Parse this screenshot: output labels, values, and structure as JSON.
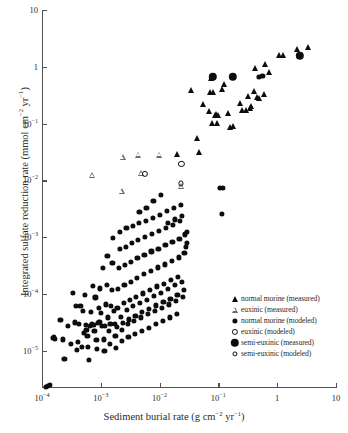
{
  "chart_data": {
    "type": "scatter",
    "title": "",
    "xlabel": "Sediment burial rate (g cm−2 yr−1)",
    "ylabel": "Integrated sulfate reduction rate (mmol cm−2 yr−1)",
    "xscale": "log",
    "yscale": "log",
    "xlim": [
      0.0001,
      10
    ],
    "ylim": [
      2.2e-06,
      10
    ],
    "grid": false,
    "legend_position": "lower-right-inside",
    "xticks": [
      {
        "value": 0.0001,
        "label": "10",
        "exp": "−4"
      },
      {
        "value": 0.001,
        "label": "10",
        "exp": "−3"
      },
      {
        "value": 0.01,
        "label": "10",
        "exp": "−2"
      },
      {
        "value": 0.1,
        "label": "10",
        "exp": "−1"
      },
      {
        "value": 1,
        "label": "1",
        "exp": ""
      },
      {
        "value": 10,
        "label": "10",
        "exp": ""
      }
    ],
    "yticks": [
      {
        "value": 10,
        "label": "10",
        "exp": ""
      },
      {
        "value": 1,
        "label": "1",
        "exp": ""
      },
      {
        "value": 0.1,
        "label": "10",
        "exp": "−1"
      },
      {
        "value": 0.01,
        "label": "10",
        "exp": "−2"
      },
      {
        "value": 0.001,
        "label": "10",
        "exp": "−3"
      },
      {
        "value": 0.0001,
        "label": "10",
        "exp": "−4"
      },
      {
        "value": 1e-05,
        "label": "10",
        "exp": "−5"
      }
    ],
    "series": [
      {
        "name": "normal marine (measured)",
        "marker": "filled-triangle",
        "color": "#0d0d0d",
        "points": [
          [
            0.0195,
            0.0295
          ],
          [
            0.0345,
            0.383
          ],
          [
            0.043,
            0.0555
          ],
          [
            0.046,
            0.0315
          ],
          [
            0.0555,
            0.222
          ],
          [
            0.068,
            0.165
          ],
          [
            0.073,
            0.36
          ],
          [
            0.075,
            0.625
          ],
          [
            0.079,
            0.104
          ],
          [
            0.082,
            0.36
          ],
          [
            0.086,
            0.143
          ],
          [
            0.092,
            0.147
          ],
          [
            0.094,
            0.104
          ],
          [
            0.1,
            0.143
          ],
          [
            0.115,
            0.4
          ],
          [
            0.125,
            0.5
          ],
          [
            0.145,
            0.151
          ],
          [
            0.155,
            0.088
          ],
          [
            0.175,
            0.092
          ],
          [
            0.23,
            0.23
          ],
          [
            0.255,
            0.175
          ],
          [
            0.3,
            0.175
          ],
          [
            0.325,
            0.3
          ],
          [
            0.34,
            0.185
          ],
          [
            0.355,
            0.205
          ],
          [
            0.4,
            0.375
          ],
          [
            0.415,
            0.955
          ],
          [
            0.455,
            0.295
          ],
          [
            0.5,
            0.285
          ],
          [
            0.6,
            0.335
          ],
          [
            0.63,
            1.12
          ],
          [
            0.72,
            0.8
          ],
          [
            1.08,
            1.58
          ],
          [
            1.25,
            1.6
          ],
          [
            2.15,
            2.05
          ],
          [
            3.4,
            2.25
          ]
        ]
      },
      {
        "name": "euxinic (measured)",
        "marker": "open-triangle",
        "color": "#6e6a6b",
        "points": [
          [
            0.00072,
            0.0122
          ],
          [
            0.00225,
            0.0064
          ],
          [
            0.00235,
            0.0255
          ],
          [
            0.00425,
            0.0285
          ],
          [
            0.0049,
            0.0133
          ],
          [
            0.0098,
            0.0285
          ],
          [
            0.0235,
            0.0079
          ]
        ]
      },
      {
        "name": "normal marine (modeled)",
        "marker": "filled-circle",
        "color": "#0d0d0d",
        "points": [
          [
            0.000116,
            2.3e-06
          ],
          [
            0.000128,
            2.4e-06
          ],
          [
            0.000137,
            2.5e-06
          ],
          [
            0.000152,
            1.68e-05
          ],
          [
            0.000158,
            1.75e-05
          ],
          [
            0.000168,
            1.62e-05
          ],
          [
            0.000205,
            3.45e-05
          ],
          [
            0.000225,
            1.58e-05
          ],
          [
            0.00024,
            7.2e-06
          ],
          [
            0.00028,
            2.75e-05
          ],
          [
            0.00031,
            1.32e-05
          ],
          [
            0.00034,
            0.000105
          ],
          [
            0.00036,
            3.15e-05
          ],
          [
            0.00038,
            6.05e-05
          ],
          [
            0.00039,
            1.02e-05
          ],
          [
            0.00041,
            1.45e-05
          ],
          [
            0.00043,
            2.95e-05
          ],
          [
            0.00045,
            6.2e-05
          ],
          [
            0.00047,
            1.18e-05
          ],
          [
            0.00049,
            5.05e-05
          ],
          [
            0.00051,
            2.05e-05
          ],
          [
            0.00053,
            9.5e-05
          ],
          [
            0.00055,
            2.85e-05
          ],
          [
            0.00057,
            2.35e-05
          ],
          [
            0.00059,
            1.82e-05
          ],
          [
            0.00061,
            1.18e-05
          ],
          [
            0.00063,
            6.8e-06
          ],
          [
            0.00066,
            2.75e-05
          ],
          [
            0.00068,
            4.8e-05
          ],
          [
            0.00071,
            2.9e-05
          ],
          [
            0.00073,
            0.000137
          ],
          [
            0.00076,
            2.82e-05
          ],
          [
            0.00078,
            2.22e-05
          ],
          [
            0.00081,
            8.7e-05
          ],
          [
            0.00084,
            1.55e-05
          ],
          [
            0.00086,
            1.08e-05
          ],
          [
            0.00089,
            3.05e-05
          ],
          [
            0.00092,
            5.75e-05
          ],
          [
            0.00095,
            3.2e-05
          ],
          [
            0.00098,
            0.000125
          ],
          [
            0.00101,
            4.65e-05
          ],
          [
            0.00104,
            2.72e-05
          ],
          [
            0.00108,
            0.000285
          ],
          [
            0.00112,
            1.58e-05
          ],
          [
            0.00115,
            9.8e-06
          ],
          [
            0.00118,
            2.75e-05
          ],
          [
            0.00122,
            6.55e-05
          ],
          [
            0.00126,
            0.000145
          ],
          [
            0.0013,
            0.00046
          ],
          [
            0.00134,
            3.85e-05
          ],
          [
            0.00138,
            2.25e-05
          ],
          [
            0.00142,
            1.32e-05
          ],
          [
            0.00146,
            2.92e-05
          ],
          [
            0.0015,
            6.15e-05
          ],
          [
            0.00154,
            0.000118
          ],
          [
            0.00158,
            0.00035
          ],
          [
            0.00163,
            0.00098
          ],
          [
            0.00168,
            4.95e-05
          ],
          [
            0.00172,
            2.95e-05
          ],
          [
            0.00177,
            1.82e-05
          ],
          [
            0.00182,
            1.12e-05
          ],
          [
            0.00187,
            2.62e-05
          ],
          [
            0.00192,
            5.75e-05
          ],
          [
            0.00197,
            0.000122
          ],
          [
            0.00203,
            0.00029
          ],
          [
            0.00208,
            0.00062
          ],
          [
            0.00214,
            0.00125
          ],
          [
            0.0022,
            3.95e-05
          ],
          [
            0.00226,
            2.35e-05
          ],
          [
            0.00232,
            1.48e-05
          ],
          [
            0.00238,
            3.05e-05
          ],
          [
            0.00245,
            6.85e-05
          ],
          [
            0.00252,
            0.000145
          ],
          [
            0.00258,
            0.00032
          ],
          [
            0.00265,
            0.00068
          ],
          [
            0.00273,
            0.00145
          ],
          [
            0.0028,
            5.25e-05
          ],
          [
            0.00288,
            2.95e-05
          ],
          [
            0.00295,
            1.72e-05
          ],
          [
            0.00303,
            3.55e-05
          ],
          [
            0.00312,
            7.75e-05
          ],
          [
            0.0032,
            0.000165
          ],
          [
            0.00329,
            0.00037
          ],
          [
            0.00338,
            0.00078
          ],
          [
            0.00347,
            0.00155
          ],
          [
            0.00357,
            6.05e-05
          ],
          [
            0.00366,
            3.35e-05
          ],
          [
            0.00376,
            1.95e-05
          ],
          [
            0.00387,
            4.15e-05
          ],
          [
            0.00397,
            8.95e-05
          ],
          [
            0.00408,
            0.000192
          ],
          [
            0.00419,
            0.00043
          ],
          [
            0.00431,
            0.00088
          ],
          [
            0.00443,
            0.00175
          ],
          [
            0.00455,
            0.00275
          ],
          [
            0.00468,
            6.95e-05
          ],
          [
            0.00481,
            3.85e-05
          ],
          [
            0.00494,
            2.25e-05
          ],
          [
            0.00508,
            4.75e-05
          ],
          [
            0.00522,
            0.000102
          ],
          [
            0.00536,
            0.000222
          ],
          [
            0.00551,
            0.00049
          ],
          [
            0.00566,
            0.00102
          ],
          [
            0.00582,
            0.00195
          ],
          [
            0.00598,
            0.00325
          ],
          [
            0.00615,
            7.95e-05
          ],
          [
            0.00632,
            4.45e-05
          ],
          [
            0.0065,
            2.55e-05
          ],
          [
            0.00668,
            5.45e-05
          ],
          [
            0.00686,
            0.000118
          ],
          [
            0.00705,
            0.000255
          ],
          [
            0.00725,
            0.00056
          ],
          [
            0.00745,
            0.00115
          ],
          [
            0.00766,
            0.00215
          ],
          [
            0.00787,
            0.0044
          ],
          [
            0.00809,
            9.2e-05
          ],
          [
            0.00832,
            5.05e-05
          ],
          [
            0.00855,
            2.95e-05
          ],
          [
            0.00879,
            6.25e-05
          ],
          [
            0.00903,
            0.000135
          ],
          [
            0.00928,
            0.000292
          ],
          [
            0.00954,
            0.00063
          ],
          [
            0.00981,
            0.00128
          ],
          [
            0.01008,
            0.00245
          ],
          [
            0.01036,
            0.0055
          ],
          [
            0.01065,
            0.000105
          ],
          [
            0.01095,
            5.75e-05
          ],
          [
            0.01125,
            3.35e-05
          ],
          [
            0.01157,
            7.15e-05
          ],
          [
            0.01189,
            0.000152
          ],
          [
            0.01222,
            0.00033
          ],
          [
            0.01256,
            0.00072
          ],
          [
            0.01291,
            0.00145
          ],
          [
            0.01327,
            0.0029
          ],
          [
            0.01364,
            0.00175
          ],
          [
            0.01402,
            0.000122
          ],
          [
            0.01441,
            6.55e-05
          ],
          [
            0.01481,
            3.85e-05
          ],
          [
            0.01523,
            8.2e-05
          ],
          [
            0.01565,
            0.000175
          ],
          [
            0.01608,
            0.00038
          ],
          [
            0.01653,
            0.00082
          ],
          [
            0.01699,
            0.00165
          ],
          [
            0.01747,
            0.0033
          ],
          [
            0.01795,
            0.00205
          ],
          [
            0.01845,
            0.000142
          ],
          [
            0.01897,
            7.55e-05
          ],
          [
            0.0195,
            4.45e-05
          ],
          [
            0.02004,
            9.45e-05
          ],
          [
            0.0206,
            0.000202
          ],
          [
            0.02117,
            0.00044
          ],
          [
            0.02176,
            0.00094
          ],
          [
            0.02237,
            0.0019
          ],
          [
            0.023,
            0.0037
          ],
          [
            0.02364,
            0.00235
          ],
          [
            0.0243,
            0.000165
          ],
          [
            0.02498,
            8.75e-05
          ],
          [
            0.02568,
            0.000117
          ],
          [
            0.0264,
            0.000525
          ],
          [
            0.02714,
            0.00112
          ],
          [
            0.0279,
            0.00068
          ],
          [
            0.0287,
            0.00078
          ],
          [
            0.0295,
            0.00125
          ],
          [
            0.105,
            0.0073
          ],
          [
            0.118,
            0.0074
          ],
          [
            0.115,
            0.00255
          ],
          [
            0.49,
            0.66
          ],
          [
            0.56,
            0.685
          ]
        ]
      },
      {
        "name": "euxinic (modeled)",
        "marker": "open-circle",
        "color": "#0d0d0d",
        "points": [
          [
            0.0056,
            0.0128
          ],
          [
            0.0235,
            0.0195
          ]
        ]
      },
      {
        "name": "semi-euxinic (measured)",
        "marker": "large-filled-circle",
        "color": "#0d0d0d",
        "points": [
          [
            0.081,
            0.665
          ],
          [
            0.175,
            0.665
          ],
          [
            2.45,
            1.55
          ]
        ]
      },
      {
        "name": "semi-euxinic (modeled)",
        "marker": "small-open-circle",
        "color": "#0d0d0d",
        "points": [
          [
            0.0232,
            0.0088
          ]
        ]
      }
    ]
  },
  "legend": {
    "entries": [
      {
        "marker": "filled-triangle",
        "label": "normal morine (measured)"
      },
      {
        "marker": "open-triangle",
        "label": "euxinic (measured)"
      },
      {
        "marker": "filled-circle",
        "label": "normal morine (modeled)"
      },
      {
        "marker": "open-circle",
        "label": "euxinic (modeled)"
      },
      {
        "marker": "large-filled-circle",
        "label": "semi-euxinic (measured)"
      },
      {
        "marker": "small-open-circle",
        "label": "semi-euxinic (modeled)"
      }
    ]
  },
  "axes": {
    "x_title_main": "Sediment burial rate (g cm",
    "x_title_sup1": "−2",
    "x_title_mid": " yr",
    "x_title_sup2": "−1",
    "x_title_end": ")",
    "y_title_main": "Integrated sulfate reduction rate (mmol cm",
    "y_title_sup1": "−2",
    "y_title_mid": " yr",
    "y_title_sup2": "−1",
    "y_title_end": ")"
  },
  "colors": {
    "marker": "#0d0d0d",
    "axis": "#555052",
    "background": "#ffffff",
    "open_marker_outline": "#6e6a6b"
  }
}
